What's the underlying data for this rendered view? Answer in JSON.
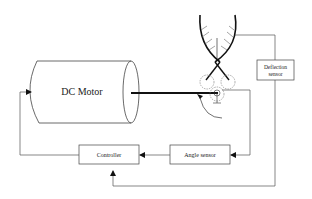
{
  "diagram": {
    "type": "block-diagram",
    "title": "",
    "blocks": {
      "motor": {
        "label": "DC Motor"
      },
      "deflection_sensor": {
        "line1": "Deflection",
        "line2": "sensor"
      },
      "angle_sensor": {
        "label": "Angle sensor"
      },
      "controller": {
        "label": "Controller"
      }
    },
    "connections": [
      {
        "from": "gripper",
        "to": "deflection_sensor"
      },
      {
        "from": "deflection_sensor",
        "to": "controller"
      },
      {
        "from": "pulley",
        "to": "angle_sensor"
      },
      {
        "from": "angle_sensor",
        "to": "controller"
      },
      {
        "from": "controller",
        "to": "motor"
      }
    ],
    "colors": {
      "stroke": "#333333",
      "shaft": "#111111",
      "background": "#ffffff"
    }
  }
}
